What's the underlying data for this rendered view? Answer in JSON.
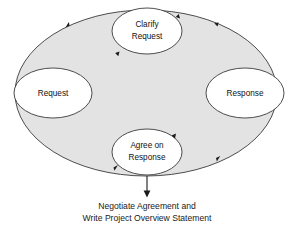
{
  "diagram": {
    "type": "cycle-diagram",
    "colors": {
      "background": "#ffffff",
      "cycle_fill": "#e3e3e3",
      "cycle_stroke": "#3a3a3a",
      "node_fill": "#ffffff",
      "node_stroke": "#3a3a3a",
      "text": "#111111",
      "arrow": "#1a1a1a"
    },
    "nodes": [
      {
        "id": "request",
        "label_line1": "Request",
        "label_line2": "",
        "position": "left"
      },
      {
        "id": "clarify",
        "label_line1": "Clarify",
        "label_line2": "Request",
        "position": "top"
      },
      {
        "id": "response",
        "label_line1": "Response",
        "label_line2": "",
        "position": "right"
      },
      {
        "id": "agree",
        "label_line1": "Agree on",
        "label_line2": "Response",
        "position": "bottom"
      }
    ],
    "flow_direction": "clockwise",
    "arrowheads": [
      {
        "id": "upper-left",
        "location": "cycle-border-upper-left",
        "points": "clockwise"
      },
      {
        "id": "upper-right",
        "location": "cycle-border-upper-right",
        "points": "clockwise"
      },
      {
        "id": "clarify-in",
        "location": "clarify-node-right",
        "points": "into-node"
      },
      {
        "id": "clarify-out",
        "location": "clarify-node-lower-left",
        "points": "out-of-node"
      },
      {
        "id": "lower-right",
        "location": "cycle-border-lower-right",
        "points": "clockwise"
      },
      {
        "id": "agree-in",
        "location": "agree-node-upper-right",
        "points": "into-node"
      },
      {
        "id": "agree-out",
        "location": "agree-node-lower-left",
        "points": "out-of-node"
      }
    ],
    "output_arrow": {
      "direction": "down",
      "from": "cycle-bottom",
      "to": "caption"
    },
    "caption": {
      "line1": "Negotiate Agreement and",
      "line2": "Write Project Overview Statement"
    }
  }
}
